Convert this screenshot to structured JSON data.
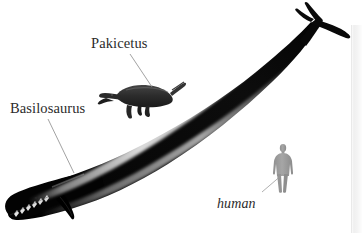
{
  "figure": {
    "name": "whale-evolution-scale-comparison",
    "background_color": "#ffffff",
    "width": 362,
    "height": 233,
    "labels": [
      {
        "id": "pakicetus",
        "text": "Pakicetus",
        "style": "roman",
        "color": "#2b2b2b",
        "leader_line": {
          "from": [
            130,
            54
          ],
          "to": [
            152,
            87
          ]
        }
      },
      {
        "id": "basilosaurus",
        "text": "Basilosaurus",
        "style": "roman",
        "color": "#2b2b2b",
        "leader_line": {
          "from": [
            48,
            119
          ],
          "to": [
            74,
            173
          ]
        }
      },
      {
        "id": "human",
        "text": "human",
        "style": "italic",
        "color": "#2b2b2b",
        "leader_line": {
          "from": [
            262,
            192
          ],
          "to": [
            283,
            174
          ]
        }
      }
    ],
    "silhouettes": [
      {
        "id": "basilosaurus",
        "description": "large dark archaeocete whale, elongated body curving from lower-left head to upper-right tail fluke",
        "fill_color": "#050505",
        "highlight_color": "#ffffff"
      },
      {
        "id": "pakicetus",
        "description": "small dark four-legged early cetacean with long snout",
        "fill_color": "#2a2a2a"
      },
      {
        "id": "human",
        "description": "gray standing human scale-reference silhouette",
        "fill_color": "#9b9b9b"
      }
    ],
    "right_panel_edge": {
      "color": "#f2f2f2",
      "border_color": "#e9e9e9"
    }
  }
}
